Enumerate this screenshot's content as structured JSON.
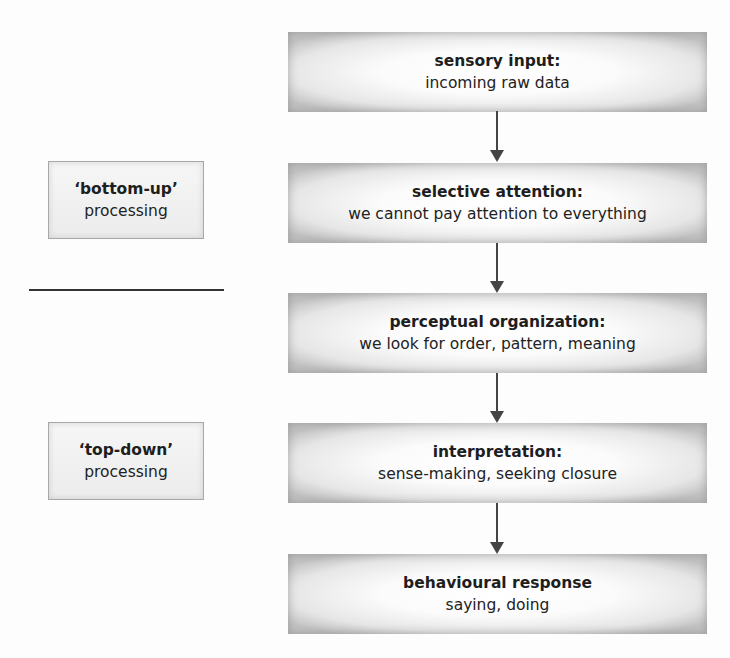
{
  "flow": {
    "stages": [
      {
        "title": "sensory input:",
        "description": "incoming raw data"
      },
      {
        "title": "selective attention:",
        "description": "we cannot pay attention to everything"
      },
      {
        "title": "perceptual organization:",
        "description": "we look for order, pattern, meaning"
      },
      {
        "title": "interpretation:",
        "description": "sense-making, seeking closure"
      },
      {
        "title": "behavioural response",
        "description": "saying, doing"
      }
    ],
    "arrow_icon": "down-arrow-icon"
  },
  "side_labels": {
    "bottom_up": {
      "title": "‘bottom-up’",
      "description": "processing"
    },
    "top_down": {
      "title": "‘top-down’",
      "description": "processing"
    }
  }
}
